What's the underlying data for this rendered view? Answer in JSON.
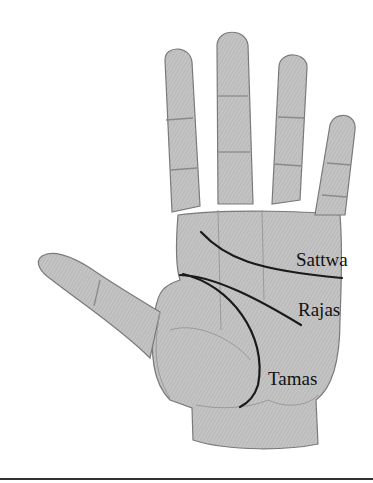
{
  "figure": {
    "labels": {
      "sattwa": "Sattwa",
      "rajas": "Rajas",
      "tamas": "Tamas"
    },
    "colors": {
      "skin": "#bdbdbd",
      "outline": "#7a7a7a",
      "crease": "#8a8a8a",
      "major_line": "#1a1a1a",
      "label_text": "#111111",
      "background": "#ffffff"
    }
  }
}
